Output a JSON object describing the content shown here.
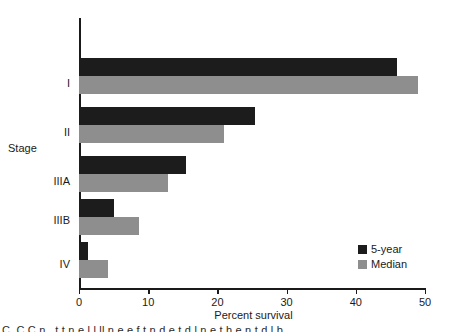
{
  "chart_data": {
    "type": "bar",
    "orientation": "horizontal",
    "title": "",
    "xlabel": "Percent survival",
    "ylabel": "Stage",
    "categories": [
      "I",
      "II",
      "IIIA",
      "IIIB",
      "IV"
    ],
    "series": [
      {
        "name": "5-year",
        "color": "#1c1c1c",
        "values": [
          46,
          25.5,
          15.5,
          5,
          1.3
        ]
      },
      {
        "name": "Median",
        "color": "#8e8e8e",
        "values": [
          49,
          21,
          12.8,
          8.6,
          4.2
        ]
      }
    ],
    "xlim": [
      0,
      50
    ],
    "xticks": [
      0,
      10,
      20,
      30,
      40,
      50
    ],
    "xtick_labels": [
      "0",
      "10",
      "20",
      "30",
      "40",
      "50"
    ],
    "grid": false,
    "legend_position": "lower right"
  },
  "legend": {
    "entries": [
      {
        "label": "5-year",
        "color": "#1c1c1c"
      },
      {
        "label": "Median",
        "color": "#8e8e8e"
      }
    ]
  },
  "caption": {
    "text": "    C_C     C     n     .    t  t       n   e     l     l  ll       n  e   e      f  t   n   d   e  t   d  l       n  e      t h    e    n  t  d  l  b"
  }
}
